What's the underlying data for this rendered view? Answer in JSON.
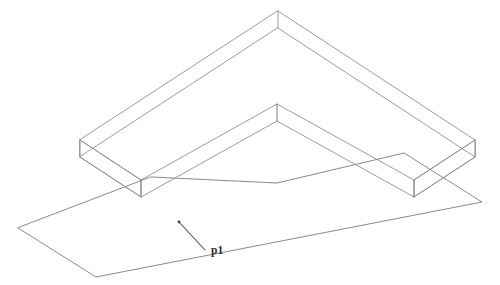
{
  "drawing": {
    "title": "Isometric wireframe of an L-shaped plate above a reference plane",
    "background_color": "#ffffff",
    "line_color": "#8a8a8a",
    "label_color": "#2e2e2e",
    "width": 500,
    "height": 285
  },
  "annotations": {
    "plane_label": "p1"
  },
  "geometry": {
    "solid": {
      "name": "l-shaped-plate",
      "top_face_outer": "278,11 475,140 475,158 414,196 277,105 140,196 80,158 80,140",
      "top_face": "278,11 475,140 414,180 277,104 141,180 80,140",
      "bottom_face": "278,28 475,157 414,197 277,121 141,197 80,157",
      "thickness_edges": [
        "278,11 278,28",
        "475,140 475,157",
        "414,180 414,197",
        "277,104 277,121",
        "141,180 141,197",
        "80,140 80,157"
      ],
      "front_left_edge": "80,140 80,157",
      "front_right_edge": "475,140 475,157",
      "inner_apex_edge": "277,104 277,121"
    },
    "plane": {
      "name": "reference-plane-p1",
      "outline": "18,228 96,277 482,202 404,153 277,183 151,177"
    },
    "leader": {
      "anchor_x": 179,
      "anchor_y": 222,
      "tip_x": 205,
      "tip_y": 250,
      "label_x": 211,
      "label_y": 254
    }
  }
}
